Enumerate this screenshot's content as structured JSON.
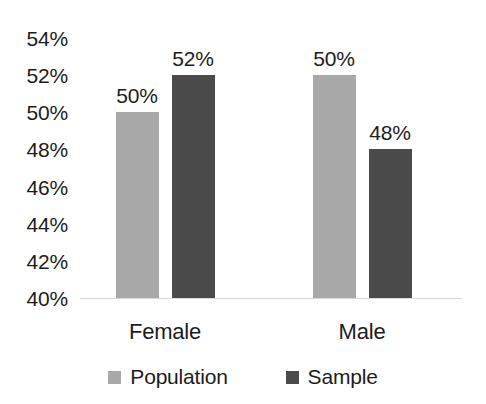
{
  "chart_data": {
    "type": "bar",
    "title": "",
    "subtitle": "",
    "xlabel": "",
    "ylabel": "",
    "categories": [
      "Female",
      "Male"
    ],
    "series": [
      {
        "name": "Population",
        "color": "#a8a8a8",
        "values": [
          50,
          52
        ],
        "labels": [
          "50%",
          "50%"
        ]
      },
      {
        "name": "Sample",
        "color": "#4a4a4a",
        "values": [
          52,
          48
        ],
        "labels": [
          "52%",
          "48%"
        ]
      }
    ],
    "series_values": {
      "Population": [
        50,
        50
      ],
      "Sample": [
        52,
        48
      ]
    },
    "data_labels": [
      {
        "category": "Female",
        "series": "Population",
        "value": 50,
        "label": "50%"
      },
      {
        "category": "Female",
        "series": "Sample",
        "value": 52,
        "label": "52%"
      },
      {
        "category": "Male",
        "series": "Population",
        "value": 50,
        "label": "50%"
      },
      {
        "category": "Male",
        "series": "Sample",
        "value": 48,
        "label": "48%"
      }
    ],
    "ylim": [
      40,
      54
    ],
    "ytick_values": [
      54,
      52,
      50,
      48,
      46,
      44,
      42,
      40
    ],
    "ytick_labels": [
      "54%",
      "52%",
      "50%",
      "48%",
      "46%",
      "44%",
      "42%",
      "40%"
    ],
    "grid": false,
    "baseline_only": true,
    "legend_position": "bottom",
    "legend": [
      "Population",
      "Sample"
    ],
    "background_color": "#ffffff",
    "text_color": "#1c1c1c",
    "axis_line_color": "#d8d8d8"
  }
}
